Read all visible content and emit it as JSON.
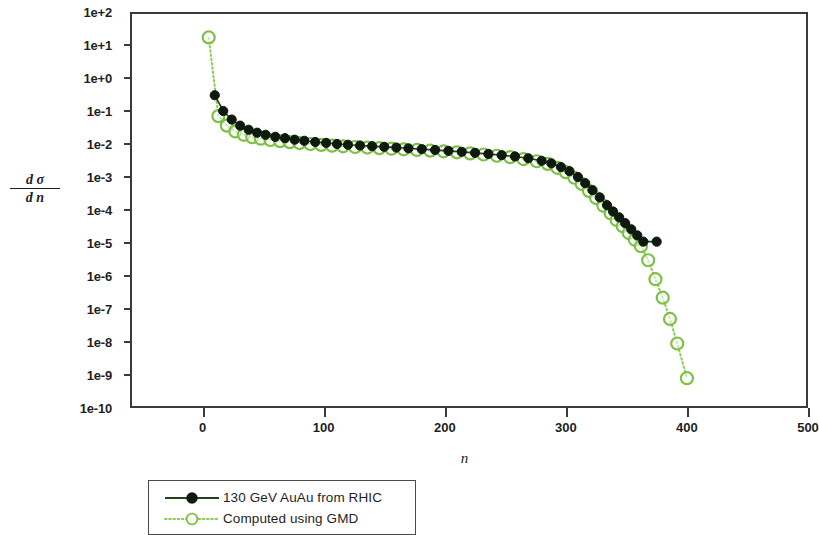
{
  "figure": {
    "background": "#ffffff",
    "frame_color": "#3a3a3a"
  },
  "colors": {
    "rhic_marker": "#0d1a0d",
    "rhic_line": "#24401c",
    "gmd_marker": "#7cc143",
    "gmd_line": "#8ecb52",
    "axis": "#3a3a3a",
    "text": "#1f1f1f"
  },
  "axes": {
    "y_title_numerator": "d σ",
    "y_title_denominator": "d n",
    "x_title": "n",
    "y_tick_labels": [
      "1e+2",
      "1e+1",
      "1e+0",
      "1e-1",
      "1e-2",
      "1e-3",
      "1e-4",
      "1e-5",
      "1e-6",
      "1e-7",
      "1e-8",
      "1e-9",
      "1e-10"
    ],
    "x_tick_labels": [
      "0",
      "100",
      "200",
      "300",
      "400",
      "500"
    ]
  },
  "legend": {
    "entries": [
      {
        "label": "130 GeV AuAu from RHIC",
        "marker": "filled-circle",
        "line": "solid",
        "color": "#0d1a0d"
      },
      {
        "label": "Computed using GMD",
        "marker": "open-circle",
        "line": "dotted",
        "color": "#7cc143"
      }
    ]
  },
  "chart_data": {
    "type": "scatter",
    "title": "",
    "subtitle": "",
    "xlabel": "n",
    "ylabel": "dσ/dn",
    "xlim": [
      -60,
      500
    ],
    "ylim": [
      1e-10,
      100.0
    ],
    "yscale": "log",
    "xscale": "linear",
    "grid": false,
    "legend_position": "below-left",
    "series": [
      {
        "name": "130 GeV AuAu from RHIC",
        "marker": "filled-circle",
        "linestyle": "solid",
        "color": "#0d1a0d",
        "x": [
          10,
          17,
          24,
          31,
          38,
          45,
          52,
          60,
          68,
          76,
          84,
          93,
          102,
          111,
          120,
          130,
          140,
          150,
          160,
          170,
          181,
          192,
          203,
          214,
          225,
          236,
          247,
          258,
          269,
          280,
          288,
          296,
          303,
          310,
          316,
          322,
          328,
          334,
          339,
          344,
          349,
          354,
          359,
          364,
          375
        ],
        "y": [
          0.3,
          0.1,
          0.055,
          0.036,
          0.027,
          0.022,
          0.019,
          0.0165,
          0.015,
          0.0135,
          0.0125,
          0.0115,
          0.0108,
          0.01,
          0.0095,
          0.009,
          0.0086,
          0.0082,
          0.0078,
          0.0074,
          0.007,
          0.0066,
          0.0062,
          0.0058,
          0.0054,
          0.005,
          0.0046,
          0.0042,
          0.0037,
          0.0031,
          0.0026,
          0.002,
          0.0015,
          0.001,
          0.00065,
          0.0004,
          0.00024,
          0.00014,
          9e-05,
          6e-05,
          4e-05,
          2.6e-05,
          1.7e-05,
          1.1e-05,
          1.1e-05
        ]
      },
      {
        "name": "Computed using GMD",
        "marker": "open-circle",
        "linestyle": "dotted",
        "color": "#7cc143",
        "x": [
          5,
          13,
          20,
          27,
          34,
          41,
          48,
          56,
          64,
          72,
          80,
          89,
          98,
          107,
          116,
          126,
          136,
          146,
          156,
          166,
          177,
          188,
          199,
          210,
          221,
          232,
          243,
          254,
          265,
          276,
          285,
          293,
          300,
          307,
          313,
          319,
          325,
          331,
          337,
          342,
          347,
          352,
          357,
          362,
          368,
          374,
          380,
          386,
          392,
          400
        ],
        "y": [
          17.0,
          0.07,
          0.036,
          0.024,
          0.019,
          0.016,
          0.0145,
          0.0132,
          0.0122,
          0.0114,
          0.0107,
          0.01,
          0.0094,
          0.0089,
          0.0085,
          0.0081,
          0.0078,
          0.0075,
          0.0072,
          0.0069,
          0.0066,
          0.0063,
          0.006,
          0.0056,
          0.0052,
          0.0048,
          0.0044,
          0.004,
          0.0035,
          0.003,
          0.0025,
          0.0019,
          0.0014,
          0.00095,
          0.00062,
          0.00038,
          0.00023,
          0.000135,
          8e-05,
          5e-05,
          3.2e-05,
          2e-05,
          1.25e-05,
          8e-06,
          3e-06,
          8e-07,
          2.2e-07,
          5e-08,
          9e-09,
          8e-10
        ]
      }
    ]
  }
}
